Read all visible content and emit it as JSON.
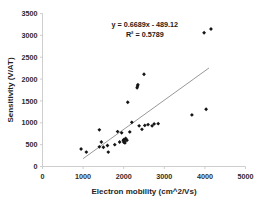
{
  "chart_data": {
    "type": "scatter",
    "title": "",
    "xlabel": "Electron mobility (cm^2/Vs)",
    "ylabel": "Sensitivity (V/AT)",
    "xlim": [
      0,
      5000
    ],
    "ylim": [
      0,
      3500
    ],
    "xticks": [
      0,
      1000,
      2000,
      3000,
      4000,
      5000
    ],
    "yticks": [
      0,
      500,
      1000,
      1500,
      2000,
      2500,
      3000,
      3500
    ],
    "xtick_labels": [
      "0",
      "1000",
      "2000",
      "3000",
      "4000",
      "5000"
    ],
    "ytick_labels": [
      "0",
      "500",
      "1000",
      "1500",
      "2000",
      "2500",
      "3000",
      "3500"
    ],
    "grid": false,
    "legend": null,
    "series": [
      {
        "name": "Sensitivity vs electron mobility",
        "marker": "diamond",
        "color": "#151515",
        "points": [
          [
            950,
            400
          ],
          [
            1080,
            330
          ],
          [
            1400,
            840
          ],
          [
            1400,
            450
          ],
          [
            1450,
            560
          ],
          [
            1500,
            440
          ],
          [
            1600,
            480
          ],
          [
            1620,
            330
          ],
          [
            1780,
            500
          ],
          [
            1850,
            800
          ],
          [
            1900,
            560
          ],
          [
            1950,
            770
          ],
          [
            1990,
            600
          ],
          [
            2000,
            560
          ],
          [
            2010,
            620
          ],
          [
            2020,
            580
          ],
          [
            2030,
            540
          ],
          [
            2050,
            640
          ],
          [
            2080,
            600
          ],
          [
            2100,
            1470
          ],
          [
            2150,
            790
          ],
          [
            2200,
            1010
          ],
          [
            2330,
            1800
          ],
          [
            2340,
            1840
          ],
          [
            2350,
            1870
          ],
          [
            2380,
            930
          ],
          [
            2450,
            850
          ],
          [
            2500,
            2110
          ],
          [
            2520,
            940
          ],
          [
            2600,
            960
          ],
          [
            2700,
            930
          ],
          [
            2750,
            975
          ],
          [
            2850,
            980
          ],
          [
            3680,
            1180
          ],
          [
            3980,
            3060
          ],
          [
            4030,
            1310
          ],
          [
            4150,
            3145
          ]
        ]
      }
    ],
    "trendline": {
      "equation": "y = 0.6689x - 489.12",
      "r_squared_label": "R² = 0.5789",
      "slope": 0.6689,
      "intercept": -489.12,
      "r_squared": 0.5789,
      "x_start": 1000,
      "x_end": 4100,
      "color": "#8c8c8c"
    },
    "annotations": [
      {
        "text": "y = 0.6689x - 489.12",
        "x": 2520,
        "y": 3200
      },
      {
        "text": "R² = 0.5789",
        "x": 2520,
        "y": 2970
      }
    ]
  }
}
